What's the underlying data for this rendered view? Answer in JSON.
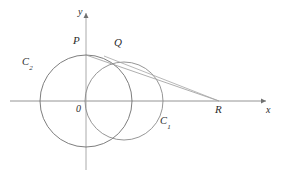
{
  "figure": {
    "kind": "geometry-diagram",
    "background_color": "#ffffff",
    "stroke_color": "#777777",
    "axis_color": "#808080",
    "label_color": "#2b2b2b",
    "canvas": {
      "width": 281,
      "height": 172
    }
  },
  "axes": {
    "x_axis": {
      "label": "x",
      "label_x": 266,
      "label_y": 106,
      "y": 101,
      "x_start": 10,
      "x_end": 268
    },
    "y_axis": {
      "label": "y",
      "label_x": 78,
      "label_y": 7,
      "x": 86,
      "y_start": 170,
      "y_end": 11
    },
    "origin": {
      "label": "0",
      "label_x": 76,
      "label_y": 104,
      "x": 86,
      "y": 101
    }
  },
  "circles": [
    {
      "name": "C2",
      "label": "C",
      "label_subscript": "2",
      "label_x": 22,
      "label_y": 57,
      "cx": 86,
      "cy": 101,
      "r": 46
    },
    {
      "name": "C1",
      "label": "C",
      "label_subscript": "1",
      "label_x": 160,
      "label_y": 116,
      "cx": 124,
      "cy": 101,
      "r": 39
    }
  ],
  "points": [
    {
      "name": "P",
      "label": "P",
      "label_x": 73,
      "label_y": 35,
      "x": 86,
      "y": 55
    },
    {
      "name": "Q",
      "label": "Q",
      "label_x": 114,
      "label_y": 37,
      "x": 120,
      "y": 62
    },
    {
      "name": "R",
      "label": "R",
      "label_x": 215,
      "label_y": 104,
      "x": 219,
      "y": 101
    }
  ],
  "lines": [
    {
      "name": "segment-P-R",
      "from": {
        "x": 86,
        "y": 55
      },
      "to": {
        "x": 219,
        "y": 101
      }
    },
    {
      "name": "segment-Q-R",
      "from": {
        "x": 108,
        "y": 57
      },
      "to": {
        "x": 219,
        "y": 101
      }
    }
  ]
}
